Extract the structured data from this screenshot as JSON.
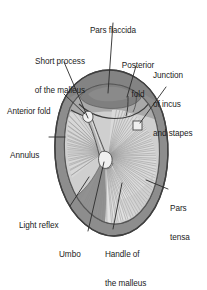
{
  "figure": {
    "view": "right tympanic membrane, otoscopic view",
    "background_color": "#ffffff",
    "colors": {
      "annulus_ring": "#8d8d8d",
      "annulus_ring_dark": "#6f6f6f",
      "membrane_base": "#c9c9c9",
      "pars_tensa_fill": "#d6d6d6",
      "pars_flaccida_fill": "#868686",
      "upper_field_fill": "#a8a8a8",
      "light_reflex_fill": "#8a8a8a",
      "malleus_handle": "#b0b0b0",
      "highlight_white": "#f2f2f2",
      "outline": "#3a3a3a",
      "leader_line": "#2b2b2b",
      "text": "#1b1b1b"
    }
  },
  "labels": [
    {
      "id": "pars-flaccida",
      "text": "Pars flaccida",
      "lines": [
        "Pars flaccida"
      ],
      "align": "center",
      "x": 113,
      "y": 8,
      "leader": {
        "x1": 113,
        "y1": 22,
        "x2": 108,
        "y2": 92
      }
    },
    {
      "id": "short-process-of-the-malleus",
      "text": "Short process of the malleus",
      "lines": [
        "Short process",
        "of the malleus"
      ],
      "align": "center",
      "x": 60,
      "y": 39,
      "leader": {
        "x1": 62,
        "y1": 62,
        "x2": 87,
        "y2": 120
      }
    },
    {
      "id": "posterior-fold",
      "text": "Posterior fold",
      "lines": [
        "Posterior",
        "fold"
      ],
      "align": "center",
      "x": 138,
      "y": 43,
      "leader": {
        "x1": 136,
        "y1": 66,
        "x2": 124,
        "y2": 96
      }
    },
    {
      "id": "junction-of-incus-and-stapes",
      "text": "Junction of incus and stapes",
      "lines": [
        "Junction",
        "of incus",
        "and stapes"
      ],
      "align": "left",
      "x": 156,
      "y": 53,
      "leader": {
        "x1": 165,
        "y1": 86,
        "x2": 138,
        "y2": 122
      }
    },
    {
      "id": "anterior-fold",
      "text": "Anterior fold",
      "lines": [
        "Anterior fold"
      ],
      "align": "left",
      "x": 7,
      "y": 89,
      "leader": {
        "x1": 62,
        "y1": 95,
        "x2": 84,
        "y2": 115
      }
    },
    {
      "id": "annulus",
      "text": "Annulus",
      "lines": [
        "Annulus"
      ],
      "align": "left",
      "x": 11,
      "y": 134,
      "leader": {
        "x1": 51,
        "y1": 138,
        "x2": 64,
        "y2": 138
      }
    },
    {
      "id": "light-reflex",
      "text": "Light reflex",
      "lines": [
        "Light reflex"
      ],
      "align": "left",
      "x": 20,
      "y": 208,
      "leader": {
        "x1": 70,
        "y1": 208,
        "x2": 88,
        "y2": 178
      }
    },
    {
      "id": "umbo",
      "text": "Umbo",
      "lines": [
        "Umbo"
      ],
      "align": "left",
      "x": 60,
      "y": 236,
      "leader": {
        "x1": 87,
        "y1": 233,
        "x2": 104,
        "y2": 160
      }
    },
    {
      "id": "handle-of-the-malleus",
      "text": "Handle of the malleus",
      "lines": [
        "Handle of",
        "the malleus"
      ],
      "align": "left",
      "x": 106,
      "y": 233,
      "leader": {
        "x1": 112,
        "y1": 230,
        "x2": 122,
        "y2": 182
      }
    },
    {
      "id": "pars-tensa",
      "text": "Pars tensa",
      "lines": [
        "Pars",
        "tensa"
      ],
      "align": "left",
      "x": 170,
      "y": 191,
      "leader": {
        "x1": 168,
        "y1": 190,
        "x2": 148,
        "y2": 178
      }
    }
  ],
  "structures": [
    {
      "id": "annulus-ring",
      "name": "annulus"
    },
    {
      "id": "pars-flaccida-region",
      "name": "pars flaccida"
    },
    {
      "id": "pars-tensa-region",
      "name": "pars tensa"
    },
    {
      "id": "malleus-handle",
      "name": "handle of the malleus"
    },
    {
      "id": "short-process-marker",
      "name": "short process of the malleus"
    },
    {
      "id": "incus-stapes-marker",
      "name": "junction of incus and stapes"
    },
    {
      "id": "umbo-marker",
      "name": "umbo"
    },
    {
      "id": "light-reflex-cone",
      "name": "light reflex"
    },
    {
      "id": "anterior-fold-line",
      "name": "anterior fold"
    },
    {
      "id": "posterior-fold-line",
      "name": "posterior fold"
    }
  ]
}
